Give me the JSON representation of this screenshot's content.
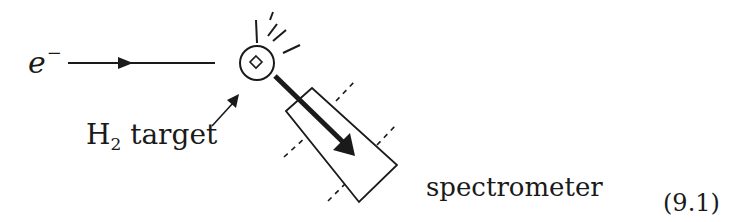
{
  "diagram": {
    "type": "experimental-setup",
    "labels": {
      "electron_symbol": "e",
      "electron_charge": "−",
      "target_element": "H",
      "target_subscript": "2",
      "target_word": " target",
      "spectrometer": "spectrometer",
      "equation_number": "(9.1)"
    },
    "colors": {
      "ink": "#1a1a1a",
      "background": "#ffffff"
    },
    "geometry": {
      "beam_line": {
        "x1": 68,
        "y1": 63,
        "x2": 215,
        "y2": 63,
        "arrow_tip_x": 133
      },
      "target_circle": {
        "cx": 257,
        "cy": 63,
        "r": 17
      },
      "target_diamond": {
        "cx": 256,
        "cy": 62,
        "half": 6
      },
      "spectrometer_body": [
        [
          286,
          111
        ],
        [
          312,
          88
        ],
        [
          397,
          165
        ],
        [
          359,
          202
        ]
      ]
    }
  }
}
